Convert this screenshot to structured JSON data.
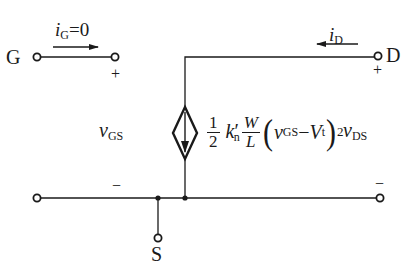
{
  "diagram": {
    "type": "MOSFET saturation-region large-signal equivalent circuit",
    "terminals": {
      "gate": "G",
      "drain": "D",
      "source": "S"
    },
    "gate_current": {
      "symbol": "i",
      "sub": "G",
      "value": "=0"
    },
    "drain_current": {
      "symbol": "i",
      "sub": "D"
    },
    "vgs": {
      "symbol": "v",
      "sub": "GS",
      "plus": "+",
      "minus": "−"
    },
    "vds": {
      "symbol": "v",
      "sub": "DS",
      "plus": "+",
      "minus": "−"
    },
    "source_expression": {
      "coef_num": "1",
      "coef_den": "2",
      "k": "k",
      "k_prime": "′",
      "k_sub": "n",
      "ratio_num": "W",
      "ratio_den": "L",
      "v": "v",
      "v_sub": "GS",
      "minus": "−",
      "vt": "V",
      "vt_sub": "t",
      "exponent": "2"
    },
    "colors": {
      "line": "#1a1a1a",
      "background": "#ffffff"
    }
  }
}
